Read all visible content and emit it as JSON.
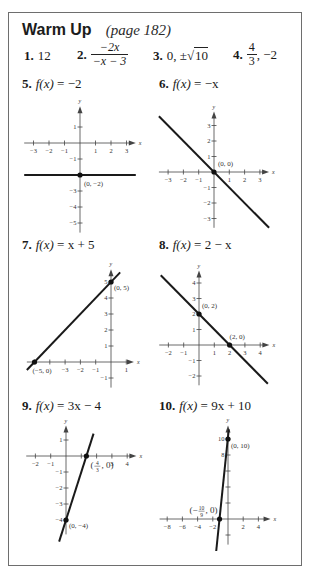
{
  "header": {
    "title": "Warm Up",
    "subtitle": "(page 182)"
  },
  "warmup_answers": [
    {
      "number": "1.",
      "answer": "12"
    },
    {
      "number": "2.",
      "numerator": "−2x",
      "denominator": "−x − 3"
    },
    {
      "number": "3.",
      "prefix": "0, ±",
      "radicand": "10"
    },
    {
      "number": "4.",
      "numerator": "4",
      "denominator": "3",
      "suffix": ", −2"
    }
  ],
  "graphs": [
    {
      "number": "5.",
      "function": "f(x) = −2",
      "fx": "f(x)",
      "rhs": " = −2",
      "origin": [
        80,
        143
      ],
      "ux": 15.5,
      "uy": 16,
      "xrange": [
        -3.6,
        3.6
      ],
      "yrange": [
        -5.6,
        2.3
      ],
      "xticks": [
        -3,
        -2,
        -1,
        1,
        2,
        3
      ],
      "yticks": [
        -5,
        -4,
        -3,
        -2,
        -1,
        1
      ],
      "xtick_labels": [
        "−3",
        "−2",
        "−1",
        "1",
        "2",
        "3"
      ],
      "ytick_labels": [
        "−5",
        "−4",
        "−3",
        "",
        "−1",
        "1"
      ],
      "line": [
        [
          -3.6,
          -2
        ],
        [
          3.6,
          -2
        ]
      ],
      "points": [
        {
          "xy": [
            0,
            -2
          ],
          "label": "(0, −2)",
          "dx": 4,
          "dy": 11
        }
      ]
    },
    {
      "number": "6.",
      "function": "f(x) = −x",
      "fx": "f(x)",
      "rhs": " = −x",
      "origin": [
        214,
        172
      ],
      "ux": 15.3,
      "uy": 15.5,
      "xrange": [
        -3.6,
        3.6
      ],
      "yrange": [
        -3.6,
        3.9
      ],
      "xticks": [
        -3,
        -2,
        -1,
        1,
        2,
        3
      ],
      "yticks": [
        -3,
        -2,
        -1,
        1,
        2,
        3
      ],
      "xtick_labels": [
        "−3",
        "−2",
        "−1",
        "1",
        "2",
        "3"
      ],
      "ytick_labels": [
        "−3",
        "−2",
        "−1",
        "1",
        "2",
        "3"
      ],
      "line": [
        [
          -3.6,
          3.6
        ],
        [
          3.6,
          -3.6
        ]
      ],
      "points": [
        {
          "xy": [
            0,
            0
          ],
          "label": "(0, 0)",
          "dx": 4,
          "dy": -6
        }
      ]
    },
    {
      "number": "7.",
      "function": "f(x) = x + 5",
      "fx": "f(x)",
      "rhs": " = x + 5",
      "origin": [
        111,
        362
      ],
      "ux": 15.3,
      "uy": 16,
      "xrange": [
        -5.5,
        1.5
      ],
      "yrange": [
        -1.6,
        5.8
      ],
      "xticks": [
        -5,
        -4,
        -3,
        -2,
        -1,
        1
      ],
      "yticks": [
        -1,
        1,
        2,
        3,
        4,
        5
      ],
      "xtick_labels": [
        "",
        "",
        "−3",
        "−2",
        "−1",
        "1"
      ],
      "ytick_labels": [
        "−1",
        "1",
        "2",
        "3",
        "4",
        "5"
      ],
      "line": [
        [
          -5.5,
          -0.5
        ],
        [
          0.6,
          5.6
        ]
      ],
      "points": [
        {
          "xy": [
            -5,
            0
          ],
          "label": "(−5, 0)",
          "dx": -2,
          "dy": 11
        },
        {
          "xy": [
            0,
            5
          ],
          "label": "(0, 5)",
          "dx": 3,
          "dy": 8
        }
      ]
    },
    {
      "number": "8.",
      "function": "f(x) = 2 − x",
      "fx": "f(x)",
      "rhs": " = 2 − x",
      "origin": [
        199,
        345
      ],
      "ux": 15.3,
      "uy": 15.5,
      "xrange": [
        -2.6,
        4.6
      ],
      "yrange": [
        -2.6,
        4.8
      ],
      "xticks": [
        -2,
        -1,
        1,
        2,
        3,
        4
      ],
      "yticks": [
        -2,
        -1,
        1,
        2,
        3,
        4
      ],
      "xtick_labels": [
        "−2",
        "−1",
        "1",
        "2",
        "3",
        "4"
      ],
      "ytick_labels": [
        "−2",
        "−1",
        "1",
        "2",
        "3",
        "4"
      ],
      "line": [
        [
          -2.5,
          4.5
        ],
        [
          4.5,
          -2.5
        ]
      ],
      "points": [
        {
          "xy": [
            0,
            2
          ],
          "label": "(0, 2)",
          "dx": 3,
          "dy": -6
        },
        {
          "xy": [
            2,
            0
          ],
          "label": "(2, 0)",
          "dx": 0,
          "dy": -6
        }
      ]
    },
    {
      "number": "9.",
      "function": "f(x) = 3x − 4",
      "fx": "f(x)",
      "rhs": " = 3x − 4",
      "origin": [
        66,
        456
      ],
      "ux": 15.3,
      "uy": 16,
      "xrange": [
        -2.6,
        4.6
      ],
      "yrange": [
        -4.9,
        1.9
      ],
      "xticks": [
        -2,
        -1,
        1,
        2,
        3,
        4
      ],
      "yticks": [
        -4,
        -3,
        -2,
        -1,
        1
      ],
      "xtick_labels": [
        "−2",
        "−1",
        "",
        "",
        "3",
        "4"
      ],
      "ytick_labels": [
        "−4",
        "−3",
        "−2",
        "−1",
        "1"
      ],
      "line": [
        [
          -0.45,
          -5.35
        ],
        [
          1.8,
          1.4
        ]
      ],
      "points": [
        {
          "xy": [
            1.333,
            0
          ],
          "label": "(4/3, 0)",
          "dx": 4,
          "dy": 12,
          "frac": true,
          "fnum": "4",
          "fden": "3"
        },
        {
          "xy": [
            0,
            -4
          ],
          "label": "(0, −4)",
          "dx": 3,
          "dy": 8
        }
      ]
    },
    {
      "number": "10.",
      "function": "f(x) = 9x + 10",
      "fx": "f(x)",
      "rhs": " = 9x + 10",
      "origin": [
        228,
        519
      ],
      "ux": 7.6,
      "uy": 8,
      "xrange": [
        -9,
        5.6
      ],
      "yrange": [
        -3.2,
        11.7
      ],
      "xticks": [
        -8,
        -6,
        -4,
        -2,
        2,
        4
      ],
      "yticks": [
        -2,
        2,
        4,
        6,
        8,
        10
      ],
      "xtick_labels": [
        "−8",
        "−6",
        "−4",
        "−2",
        "2",
        "4"
      ],
      "ytick_labels": [
        "",
        "",
        "",
        "",
        "8",
        "10"
      ],
      "line": [
        [
          -1.55,
          -4
        ],
        [
          0.1,
          11.2
        ]
      ],
      "points": [
        {
          "xy": [
            -1.111,
            0
          ],
          "label": "(−10/9, 0)",
          "dx": -30,
          "dy": -6,
          "frac": true,
          "fnum": "10",
          "fden": "9",
          "neg": true
        },
        {
          "xy": [
            0,
            10
          ],
          "label": "(0, 10)",
          "dx": 3,
          "dy": 9
        }
      ]
    }
  ],
  "graph_labels_pos": [
    {
      "left": 22,
      "top": 87
    },
    {
      "left": 162,
      "top": 87
    },
    {
      "left": 22,
      "top": 241
    },
    {
      "left": 162,
      "top": 241
    },
    {
      "left": 22,
      "top": 401
    },
    {
      "left": 162,
      "top": 401
    }
  ],
  "colors": {
    "line": "#1a1a1a",
    "axis": "#444444",
    "border": "#6e6e6e"
  }
}
